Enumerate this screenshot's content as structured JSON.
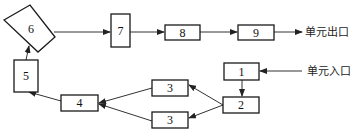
{
  "diagram": {
    "type": "flowchart",
    "nodes": [
      {
        "id": "n1",
        "label": "1"
      },
      {
        "id": "n2",
        "label": "2"
      },
      {
        "id": "n3a",
        "label": "3"
      },
      {
        "id": "n3b",
        "label": "3"
      },
      {
        "id": "n4",
        "label": "4"
      },
      {
        "id": "n5",
        "label": "5"
      },
      {
        "id": "n6",
        "label": "6"
      },
      {
        "id": "n7",
        "label": "7"
      },
      {
        "id": "n8",
        "label": "8"
      },
      {
        "id": "n9",
        "label": "9"
      }
    ],
    "edges": [
      {
        "from": "entrance",
        "to": "n1"
      },
      {
        "from": "n1",
        "to": "n2"
      },
      {
        "from": "n2",
        "to": "n3a"
      },
      {
        "from": "n2",
        "to": "n3b"
      },
      {
        "from": "n3a",
        "to": "n4"
      },
      {
        "from": "n3b",
        "to": "n4"
      },
      {
        "from": "n4",
        "to": "n5"
      },
      {
        "from": "n5",
        "to": "n6"
      },
      {
        "from": "n6",
        "to": "n7"
      },
      {
        "from": "n7",
        "to": "n8"
      },
      {
        "from": "n8",
        "to": "n9"
      },
      {
        "from": "n9",
        "to": "exit"
      }
    ],
    "labels": {
      "exit": "单元出口",
      "entrance": "单元入口"
    },
    "colors": {
      "stroke": "#1a1a1a",
      "background": "#ffffff"
    }
  }
}
